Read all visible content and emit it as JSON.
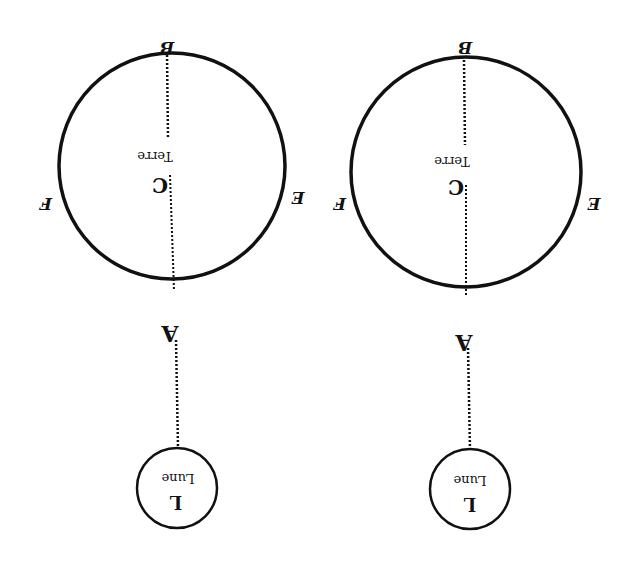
{
  "figure": {
    "orientation": "rotated-180",
    "background": "#ffffff",
    "ink": "#111111",
    "diagrams": [
      {
        "id": "left",
        "earth": {
          "label": "Terre",
          "center_label": "C",
          "cx": 172,
          "cy": 166,
          "r": 113
        },
        "points": {
          "top": "B",
          "left": "F",
          "right": "E",
          "bottom": "A"
        },
        "moon": {
          "label": "Lune",
          "letter": "L",
          "cx": 177,
          "cy": 488,
          "r": 40
        }
      },
      {
        "id": "right",
        "earth": {
          "label": "Terre",
          "center_label": "C",
          "cx": 466,
          "cy": 172,
          "r": 115
        },
        "points": {
          "top": "B",
          "left": "F",
          "right": "E",
          "bottom": "A"
        },
        "moon": {
          "label": "Lune",
          "letter": "L",
          "cx": 470,
          "cy": 489,
          "r": 40
        }
      }
    ]
  }
}
